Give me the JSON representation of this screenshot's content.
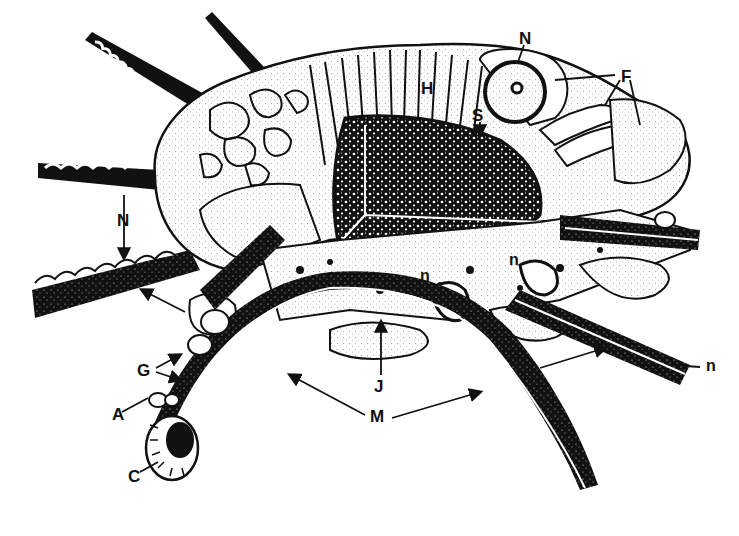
{
  "figure": {
    "colors": {
      "ink": "#111111",
      "paper": "#ffffff",
      "stipple": "#cfcfcf"
    },
    "labels": [
      {
        "id": "N_top",
        "text": "N",
        "x": 519,
        "y": 30
      },
      {
        "id": "F",
        "text": "F",
        "x": 621,
        "y": 68
      },
      {
        "id": "H",
        "text": "H",
        "x": 421,
        "y": 88
      },
      {
        "id": "S",
        "text": "S",
        "x": 473,
        "y": 113
      },
      {
        "id": "N_left",
        "text": "N",
        "x": 117,
        "y": 210
      },
      {
        "id": "n_1",
        "text": "n",
        "x": 422,
        "y": 272
      },
      {
        "id": "n_2",
        "text": "n",
        "x": 509,
        "y": 259
      },
      {
        "id": "n_3",
        "text": "n",
        "x": 706,
        "y": 360
      },
      {
        "id": "G",
        "text": "G",
        "x": 138,
        "y": 362
      },
      {
        "id": "J",
        "text": "J",
        "x": 372,
        "y": 378
      },
      {
        "id": "M",
        "text": "M",
        "x": 371,
        "y": 414
      },
      {
        "id": "A",
        "text": "A",
        "x": 113,
        "y": 408
      },
      {
        "id": "C",
        "text": "C",
        "x": 128,
        "y": 470
      }
    ]
  }
}
